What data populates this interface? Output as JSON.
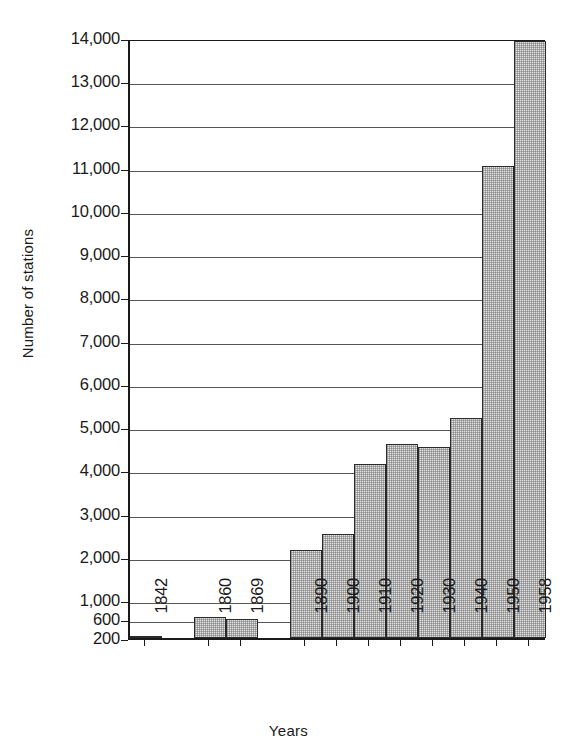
{
  "chart_data": {
    "type": "bar",
    "title": "",
    "xlabel": "Years",
    "ylabel": "Number of stations",
    "categories": [
      "1842",
      "1860",
      "1869",
      "1890",
      "1900",
      "1910",
      "1920",
      "1930",
      "1940",
      "1950",
      "1958"
    ],
    "values": [
      200,
      640,
      600,
      2150,
      2530,
      4150,
      4600,
      4540,
      5200,
      11050,
      13930
    ],
    "ytick_labels": [
      "200",
      "600",
      "1,000",
      "2,000",
      "3,000",
      "4,000",
      "5,000",
      "6,000",
      "7,000",
      "8,000",
      "9,000",
      "10,000",
      "11,000",
      "12,000",
      "13,000",
      "14,000"
    ],
    "ytick_values": [
      200,
      600,
      1000,
      2000,
      3000,
      4000,
      5000,
      6000,
      7000,
      8000,
      9000,
      10000,
      11000,
      12000,
      13000,
      14000
    ],
    "ylim": [
      200,
      14000
    ],
    "grid": true,
    "legend": "none"
  },
  "axes": {
    "y_title": "Number of stations",
    "x_title": "Years"
  },
  "colors": {
    "bar_fill": "#e4e4e4",
    "bar_stroke": "#2a2a2a",
    "gridline": "#565656",
    "text": "#1a1a1a",
    "background": "#ffffff"
  }
}
